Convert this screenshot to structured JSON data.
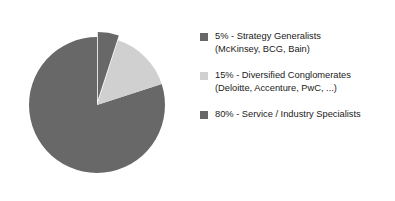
{
  "chart_data": {
    "type": "pie",
    "title": "",
    "subtitle": "",
    "xlabel": "",
    "ylabel": "",
    "grid": false,
    "legend_position": "right",
    "total": 100,
    "units": "percent",
    "start_angle_deg": 0,
    "direction": "clockwise",
    "categories": [
      "Strategy Generalists",
      "Diversified Conglomerates",
      "Service / Industry Specialists"
    ],
    "values": [
      5,
      15,
      80
    ],
    "slices": [
      {
        "label": "Strategy Generalists",
        "value": 5,
        "value_label": "5%",
        "examples": "(McKinsey, BCG, Bain)",
        "color": "#686868",
        "exploded": true
      },
      {
        "label": "Diversified Conglomerates",
        "value": 15,
        "value_label": "15%",
        "examples": "(Deloitte, Accenture, PwC, ...)",
        "color": "#d0d0d0",
        "exploded": false
      },
      {
        "label": "Service / Industry Specialists",
        "value": 80,
        "value_label": "80%",
        "examples": "",
        "color": "#686868",
        "exploded": false
      }
    ]
  },
  "legend": {
    "entries": [
      {
        "swatch_color": "#686868",
        "line1": "5% - Strategy Generalists",
        "line2": "(McKinsey, BCG, Bain)"
      },
      {
        "swatch_color": "#d0d0d0",
        "line1": "15% - Diversified Conglomerates",
        "line2": "(Deloitte, Accenture, PwC, ...)"
      },
      {
        "swatch_color": "#686868",
        "line1": "80% - Service / Industry Specialists",
        "line2": ""
      }
    ]
  },
  "colors": {
    "background": "#ffffff",
    "dark_slice": "#686868",
    "light_slice": "#d0d0d0",
    "text": "#1a1a1a"
  }
}
